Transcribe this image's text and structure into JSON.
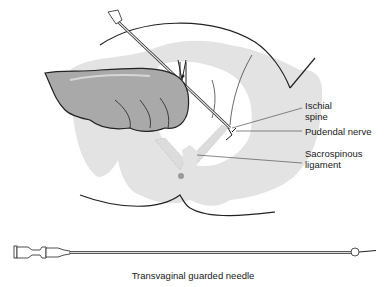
{
  "figure": {
    "labels": [
      {
        "id": "ischial-spine",
        "text": "Ischial\nspine"
      },
      {
        "id": "pudendal-nerve",
        "text": "Pudendal nerve"
      },
      {
        "id": "sacrospinous-ligament",
        "text": "Sacrospinous\nligament"
      }
    ],
    "caption": "Transvaginal guarded needle"
  },
  "colors": {
    "pelvis_fill": "#e3e3e3",
    "glove_fill": "#a9a9a9",
    "glove_highlight": "#d6d6d6",
    "outline": "#222222",
    "leader_line": "#555555",
    "ligament_fill": "#dcdcdc",
    "marker": "#9a9a9a"
  }
}
